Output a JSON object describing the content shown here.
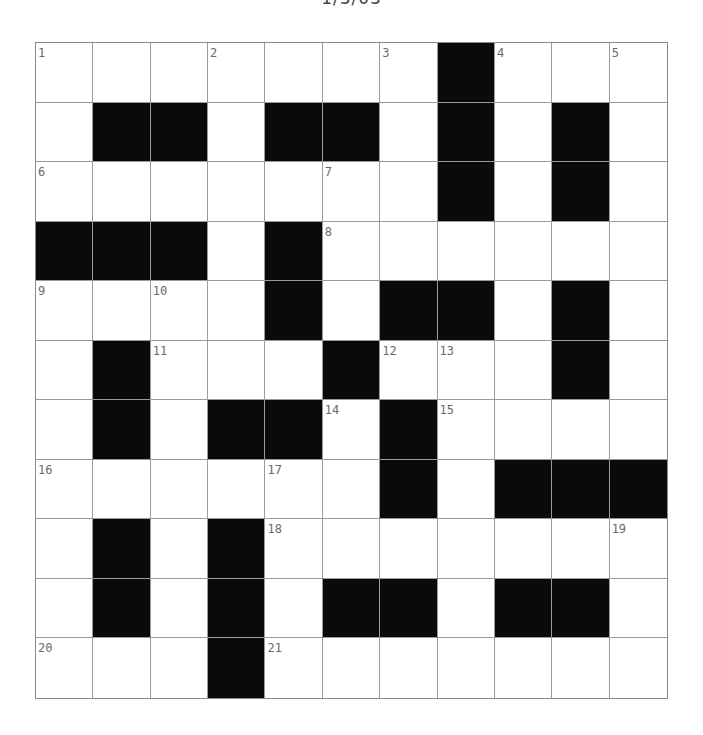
{
  "title": "1/3/03",
  "grid": {
    "rows": 11,
    "cols": 11,
    "colors": {
      "block": "#0a0a0a",
      "empty": "#ffffff",
      "line": "#9a9a9a",
      "number": "#6a6a6a"
    },
    "layout": [
      "1..2..3#4.5",
      ".##.##.#.#.",
      "6....7.#.#.",
      "###.#8.....",
      "9.10.#.##.#.",
      ".#11..#1213.#.",
      ".#.##14#15...",
      "16...17.#.###",
      ".#.#18.....19",
      ".#.#.##.##.",
      "20..#21......"
    ],
    "cells": [
      [
        {
          "n": "1"
        },
        {},
        {},
        {
          "n": "2"
        },
        {},
        {},
        {
          "n": "3"
        },
        {
          "b": 1
        },
        {
          "n": "4"
        },
        {},
        {
          "n": "5"
        }
      ],
      [
        {},
        {
          "b": 1
        },
        {
          "b": 1
        },
        {},
        {
          "b": 1
        },
        {
          "b": 1
        },
        {},
        {
          "b": 1
        },
        {},
        {
          "b": 1
        },
        {}
      ],
      [
        {
          "n": "6"
        },
        {},
        {},
        {},
        {},
        {
          "n": "7"
        },
        {},
        {
          "b": 1
        },
        {},
        {
          "b": 1
        },
        {}
      ],
      [
        {
          "b": 1
        },
        {
          "b": 1
        },
        {
          "b": 1
        },
        {},
        {
          "b": 1
        },
        {
          "n": "8"
        },
        {},
        {},
        {},
        {},
        {}
      ],
      [
        {
          "n": "9"
        },
        {},
        {
          "n": "10"
        },
        {},
        {
          "b": 1
        },
        {},
        {
          "b": 1
        },
        {
          "b": 1
        },
        {},
        {
          "b": 1
        },
        {}
      ],
      [
        {},
        {
          "b": 1
        },
        {
          "n": "11"
        },
        {},
        {},
        {
          "b": 1
        },
        {
          "n": "12"
        },
        {
          "n": "13"
        },
        {},
        {
          "b": 1
        },
        {}
      ],
      [
        {},
        {
          "b": 1
        },
        {},
        {
          "b": 1
        },
        {
          "b": 1
        },
        {
          "n": "14"
        },
        {
          "b": 1
        },
        {
          "n": "15"
        },
        {},
        {},
        {}
      ],
      [
        {
          "n": "16"
        },
        {},
        {},
        {},
        {
          "n": "17"
        },
        {},
        {
          "b": 1
        },
        {},
        {
          "b": 1
        },
        {
          "b": 1
        },
        {
          "b": 1
        }
      ],
      [
        {},
        {
          "b": 1
        },
        {},
        {
          "b": 1
        },
        {
          "n": "18"
        },
        {},
        {},
        {},
        {},
        {},
        {
          "n": "19"
        }
      ],
      [
        {},
        {
          "b": 1
        },
        {},
        {
          "b": 1
        },
        {},
        {
          "b": 1
        },
        {
          "b": 1
        },
        {},
        {
          "b": 1
        },
        {
          "b": 1
        },
        {}
      ],
      [
        {
          "n": "20"
        },
        {},
        {},
        {
          "b": 1
        },
        {
          "n": "21"
        },
        {},
        {},
        {},
        {},
        {},
        {}
      ]
    ]
  }
}
